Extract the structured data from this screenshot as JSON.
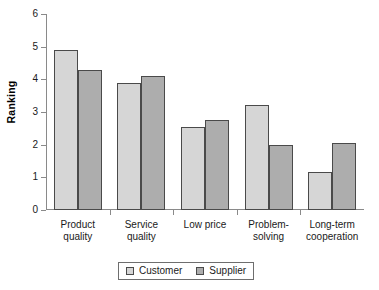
{
  "chart_data": {
    "type": "bar",
    "title": "",
    "subtitle": "",
    "xlabel": "",
    "ylabel": "Ranking",
    "ylim": [
      0,
      6
    ],
    "ytick_labels": [
      "6",
      "5",
      "4",
      "3",
      "2",
      "1",
      "0"
    ],
    "ytick_values": [
      6,
      5,
      4,
      3,
      2,
      1,
      0
    ],
    "grid": false,
    "legend_position": "bottom-center",
    "categories": [
      "Product quality",
      "Service quality",
      "Low price",
      "Problem-solving",
      "Long-term cooperation"
    ],
    "category_lines": [
      [
        "Product",
        "quality"
      ],
      [
        "Service",
        "quality"
      ],
      [
        "Low price",
        ""
      ],
      [
        "Problem-",
        "solving"
      ],
      [
        "Long-term",
        "cooperation"
      ]
    ],
    "series": [
      {
        "name": "Customer",
        "color": "#d6d6d6",
        "values": [
          4.9,
          3.9,
          2.55,
          3.2,
          1.15
        ]
      },
      {
        "name": "Supplier",
        "color": "#adadad",
        "values": [
          4.3,
          4.1,
          2.75,
          2.0,
          2.05
        ]
      }
    ]
  },
  "legend": {
    "items": [
      {
        "label": "Customer",
        "swatch": "customer-swatch"
      },
      {
        "label": "Supplier",
        "swatch": "supplier-swatch"
      }
    ]
  },
  "colors": {
    "customer": "#d6d6d6",
    "supplier": "#adadad",
    "bar_border": "#4a4a4a",
    "axis": "#8a8a8a",
    "text": "#1a1a1a",
    "background": "#ffffff"
  }
}
